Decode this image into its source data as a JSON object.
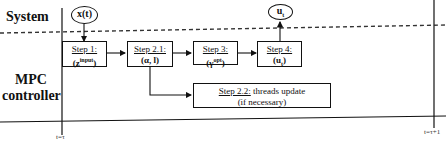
{
  "lanes": {
    "system": "System",
    "controller_line1": "MPC",
    "controller_line2": "controller"
  },
  "inputs": {
    "state": "x(t)",
    "output": "u",
    "output_sub": "t"
  },
  "steps": [
    {
      "title": "Step 1:",
      "value": "(z",
      "sup": "input",
      "value_end": ")"
    },
    {
      "title": "Step 2.1:",
      "value": "(α, l)"
    },
    {
      "title": "Step 3:",
      "value": "(γ",
      "sup": "opt",
      "value_end": ")"
    },
    {
      "title": "Step 4:",
      "value": "(u",
      "sub": "t",
      "value_end": ")"
    },
    {
      "title": "Step 2.2:",
      "desc": " threads update",
      "desc2": "(if necessary)"
    }
  ],
  "time": {
    "start": "t=τ",
    "end": "t=τ+1"
  },
  "colors": {
    "line": "#111111",
    "background": "#ffffff"
  }
}
